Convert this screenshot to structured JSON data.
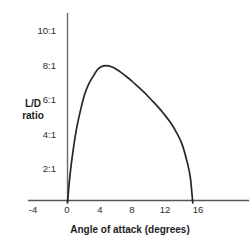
{
  "chart_data": {
    "type": "line",
    "title": "",
    "xlabel": "Angle of attack (degrees)",
    "ylabel": "L/D ratio",
    "ylabel_lines": [
      "L/D",
      "ratio"
    ],
    "xlim": [
      -5.0,
      22.0
    ],
    "ylim": [
      0,
      11.0
    ],
    "grid": false,
    "legend": null,
    "xticks": [
      -4,
      0,
      4,
      8,
      12,
      16
    ],
    "xtick_labels": [
      "-4",
      "0",
      "4",
      "8",
      "12",
      "16"
    ],
    "yticks": [
      2,
      4,
      6,
      8,
      10
    ],
    "ytick_labels": [
      "2:1",
      "4:1",
      "6:1",
      "8:1",
      "10:1"
    ],
    "series": [
      {
        "name": "L/D ratio",
        "color": "#262626",
        "x": [
          0.0,
          0.3,
          0.7,
          1.1,
          1.6,
          2.1,
          2.6,
          3.2,
          3.8,
          4.4,
          5.0,
          5.6,
          6.3,
          7.0,
          7.8,
          8.6,
          9.4,
          10.2,
          11.0,
          11.8,
          12.6,
          13.3,
          14.0,
          14.6,
          15.0,
          15.3
        ],
        "y": [
          0.0,
          1.6,
          3.1,
          4.3,
          5.4,
          6.3,
          6.9,
          7.4,
          7.8,
          7.95,
          7.95,
          7.85,
          7.65,
          7.4,
          7.1,
          6.75,
          6.4,
          6.0,
          5.6,
          5.15,
          4.65,
          4.1,
          3.4,
          2.4,
          1.5,
          0.0
        ]
      }
    ],
    "annotations": {
      "peak_value": "8:1",
      "peak_angle_degrees": 4.6,
      "zero_crossing_degrees": 15.3
    }
  },
  "axes": {
    "y_axis_name": "vertical-axis-line",
    "x_axis_name": "horizontal-axis-line",
    "axis_color": "#555555"
  }
}
